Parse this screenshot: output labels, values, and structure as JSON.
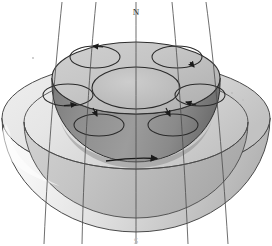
{
  "figure": {
    "pole_north_label": "N",
    "pole_south_label": "S",
    "colors": {
      "background": "#ffffff",
      "outer_shell_light": "#f4f4f4",
      "outer_shell_mid": "#d9d9d9",
      "outer_shell_shadow": "#9a9a9a",
      "inner_core_top": "#c9c9c9",
      "inner_core_body": "#8d8d8d",
      "inner_core_dark": "#6e6e6e",
      "outline": "#3a3a3a",
      "field_line": "#4a4a4a",
      "arrow": "#1a1a1a"
    },
    "outer_shell": {
      "name": "outer-shell",
      "center_x": 136,
      "center_y": 118,
      "rim_rx": 134,
      "rim_ry": 56,
      "bottom_y": 232
    },
    "inner_core": {
      "name": "inner-core",
      "center_x": 136,
      "top_y": 78,
      "rx": 84,
      "ry": 36,
      "depth": 72
    },
    "central_ellipse": {
      "name": "central-ellipse",
      "cx": 136,
      "cy": 88,
      "rx": 44,
      "ry": 21
    },
    "convection_rolls": [
      {
        "id": 1,
        "label": "roll-top-left",
        "cx": 95,
        "cy": 57,
        "rx": 24,
        "ry": 11,
        "arrow_angle": 200,
        "arrow_dir": "left"
      },
      {
        "id": 2,
        "label": "roll-top-right",
        "cx": 177,
        "cy": 57,
        "rx": 24,
        "ry": 11,
        "arrow_angle": 340,
        "arrow_dir": "down-right"
      },
      {
        "id": 3,
        "label": "roll-mid-left",
        "cx": 68,
        "cy": 94,
        "rx": 24,
        "ry": 11,
        "arrow_angle": 20,
        "arrow_dir": "right"
      },
      {
        "id": 4,
        "label": "roll-mid-right",
        "cx": 199,
        "cy": 94,
        "rx": 24,
        "ry": 11,
        "arrow_angle": 200,
        "arrow_dir": "left"
      },
      {
        "id": 5,
        "label": "roll-bottom-left",
        "cx": 99,
        "cy": 124,
        "rx": 24,
        "ry": 11,
        "arrow_angle": 20,
        "arrow_dir": "right"
      },
      {
        "id": 6,
        "label": "roll-bottom-right",
        "cx": 173,
        "cy": 124,
        "rx": 24,
        "ry": 11,
        "arrow_angle": 20,
        "arrow_dir": "right"
      }
    ],
    "rotation_arrow": {
      "name": "rotation-arrow",
      "x_start": 106,
      "x_end": 160,
      "y": 160,
      "direction": "right"
    },
    "field_lines": [
      {
        "id": 1,
        "top_x": 62,
        "bottom_x": 48,
        "bulge": 12
      },
      {
        "id": 2,
        "top_x": 95,
        "bottom_x": 84,
        "bulge": 8
      },
      {
        "id": 3,
        "top_x": 136,
        "bottom_x": 136,
        "bulge": 0
      },
      {
        "id": 4,
        "top_x": 170,
        "bottom_x": 182,
        "bulge": -8
      },
      {
        "id": 5,
        "top_x": 203,
        "bottom_x": 214,
        "bulge": -12
      }
    ],
    "field_line_count": 5,
    "convection_roll_count": 6
  }
}
